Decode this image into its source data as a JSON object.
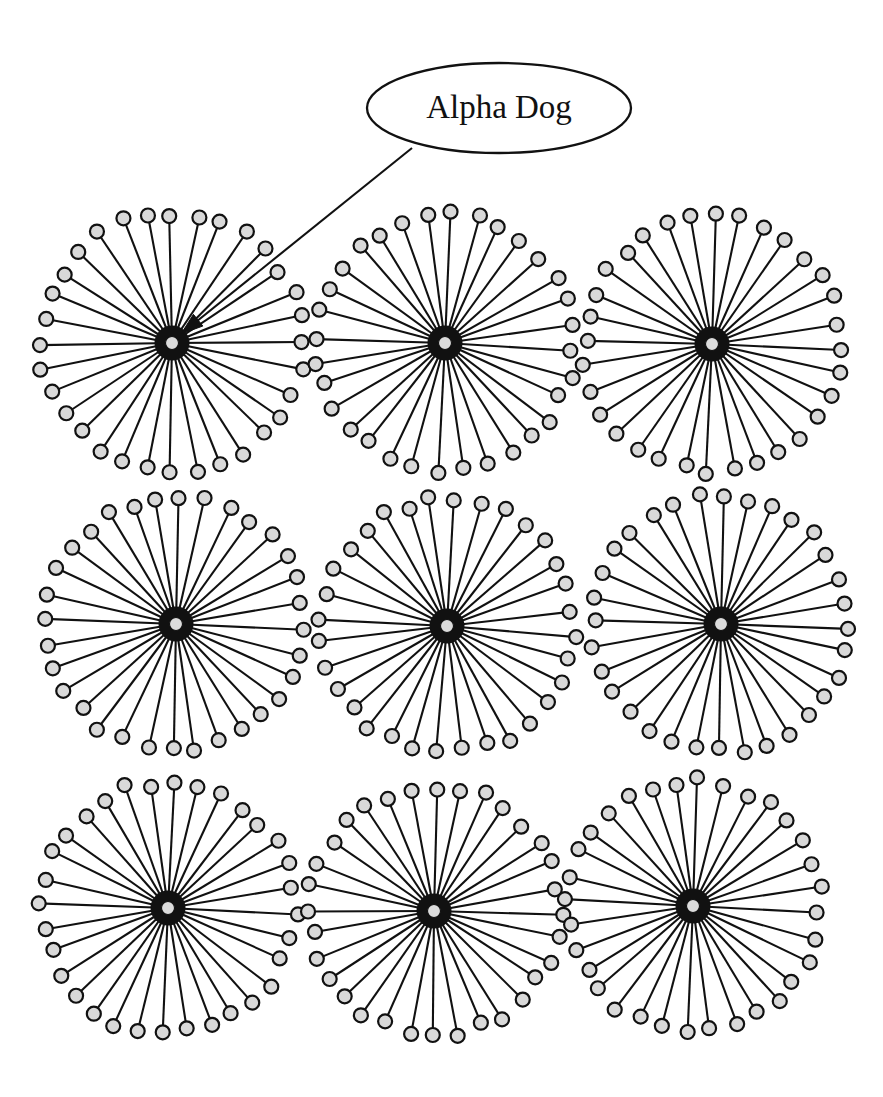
{
  "figure": {
    "title": "Alpha Dog",
    "background_color": "#ffffff",
    "width": 883,
    "height": 1097
  },
  "callout": {
    "label": "Alpha Dog",
    "shape": "ellipse",
    "cx": 499,
    "cy": 108,
    "rx": 132,
    "ry": 45,
    "fill": "#ffffff",
    "stroke": "#111111",
    "font_size": 33,
    "leader": {
      "from_x": 412,
      "from_y": 148,
      "to_x": 186,
      "to_y": 330,
      "arrow": "filled-triangle",
      "arrow_tip_x": 181,
      "arrow_tip_y": 334,
      "stroke": "#111111"
    }
  },
  "style": {
    "leaf_fill": "#d9d9d9",
    "leaf_stroke": "#111111",
    "leaf_radius": 7.0,
    "spoke_stroke": "#111111",
    "spoke_width": 2.1,
    "hub_ring_fill": "#111111",
    "hub_ring_radius": 17.5,
    "hub_core_fill": "#dcdcdc",
    "hub_core_radius": 6.5
  },
  "chart_data": {
    "type": "diagram",
    "graph_type": "star / hub-and-spoke network",
    "title": "Alpha Dog",
    "xlabel": "",
    "ylabel": "",
    "grid": false,
    "legend": false,
    "n_graphs": 9,
    "grid_layout": {
      "rows": 3,
      "cols": 3
    },
    "spokes_per_graph": 32,
    "leaves_per_graph": 32,
    "nodes_per_graph": 33,
    "edges_per_graph": 32,
    "annotations": [
      {
        "text": "Alpha Dog",
        "points_to": "hub of graph 1 (row 1, column 1)"
      }
    ],
    "graphs": [
      {
        "id": 1,
        "row": 1,
        "col": 1,
        "cx": 172,
        "cy": 343,
        "radius": 130,
        "spokes": 32,
        "rotation_deg": 0,
        "labelled": true
      },
      {
        "id": 2,
        "row": 1,
        "col": 2,
        "cx": 445,
        "cy": 343,
        "radius": 128,
        "spokes": 32,
        "rotation_deg": 3,
        "labelled": false
      },
      {
        "id": 3,
        "row": 1,
        "col": 3,
        "cx": 712,
        "cy": 344,
        "radius": 128,
        "spokes": 32,
        "rotation_deg": 1.5,
        "labelled": false
      },
      {
        "id": 4,
        "row": 2,
        "col": 1,
        "cx": 176,
        "cy": 624,
        "radius": 128,
        "spokes": 32,
        "rotation_deg": 2,
        "labelled": false
      },
      {
        "id": 5,
        "row": 2,
        "col": 2,
        "cx": 447,
        "cy": 626,
        "radius": 127,
        "spokes": 32,
        "rotation_deg": 4,
        "labelled": false
      },
      {
        "id": 6,
        "row": 2,
        "col": 3,
        "cx": 721,
        "cy": 624,
        "radius": 128,
        "spokes": 32,
        "rotation_deg": 1,
        "labelled": false
      },
      {
        "id": 7,
        "row": 3,
        "col": 1,
        "cx": 168,
        "cy": 908,
        "radius": 126,
        "spokes": 32,
        "rotation_deg": 2.5,
        "labelled": false
      },
      {
        "id": 8,
        "row": 3,
        "col": 2,
        "cx": 434,
        "cy": 911,
        "radius": 125,
        "spokes": 32,
        "rotation_deg": 0.5,
        "labelled": false
      },
      {
        "id": 9,
        "row": 3,
        "col": 3,
        "cx": 693,
        "cy": 906,
        "radius": 126,
        "spokes": 32,
        "rotation_deg": 3,
        "labelled": false
      }
    ]
  }
}
